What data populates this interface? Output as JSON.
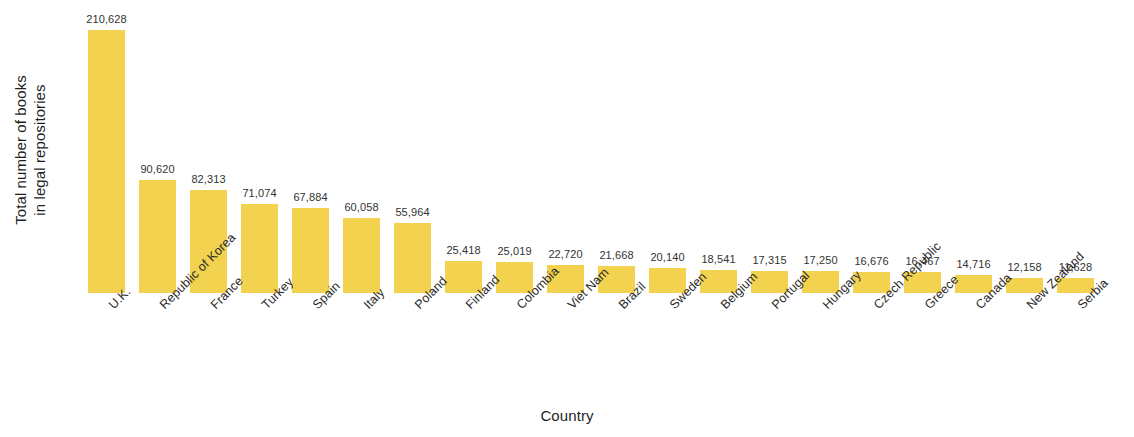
{
  "chart_data": {
    "type": "bar",
    "title": "",
    "subtitle": "",
    "xlabel": "Country",
    "ylabel_lines": [
      "Total number of books",
      "in legal repositories"
    ],
    "ylabel": "Total number of books in legal repositories",
    "categories": [
      "U.K.",
      "Republic of Korea",
      "France",
      "Turkey",
      "Spain",
      "Italy",
      "Poland",
      "Finland",
      "Colombia",
      "Viet Nam",
      "Brazil",
      "Sweden",
      "Belgium",
      "Portugal",
      "Hungary",
      "Czech Republic",
      "Greece",
      "Canada",
      "New Zealand",
      "Serbia"
    ],
    "values": [
      210628,
      90620,
      82313,
      71074,
      67884,
      60058,
      55964,
      25418,
      25019,
      22720,
      21668,
      20140,
      18541,
      17315,
      17250,
      16676,
      16467,
      14716,
      12158,
      11628
    ],
    "value_labels": [
      "210,628",
      "90,620",
      "82,313",
      "71,074",
      "67,884",
      "60,058",
      "55,964",
      "25,418",
      "25,019",
      "22,720",
      "21,668",
      "20,140",
      "18,541",
      "17,315",
      "17,250",
      "16,676",
      "16,467",
      "14,716",
      "12,158",
      "11,628"
    ],
    "ylim": [
      0,
      210628
    ],
    "grid": false,
    "legend": false,
    "legend_position": "none",
    "bar_color": "#f2d24f",
    "value_label_color": "#333333",
    "axis_text_color": "#1f1f1f",
    "background_color": "#ffffff"
  }
}
